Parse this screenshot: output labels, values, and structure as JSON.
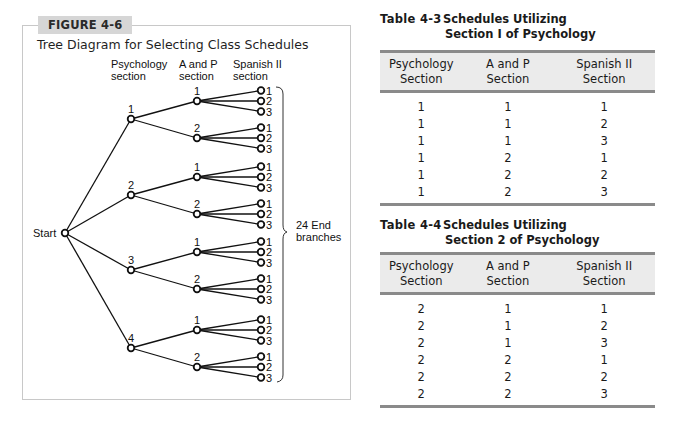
{
  "figure": {
    "tag": "FIGURE 4-6",
    "title": "Tree Diagram for Selecting Class Schedules",
    "column_headers": {
      "psychology": [
        "Psychology",
        "section"
      ],
      "anp": [
        "A and P",
        "section"
      ],
      "spanish": [
        "Spanish II",
        "section"
      ]
    },
    "start_label": "Start",
    "brace_label": [
      "24 End",
      "branches"
    ],
    "tree": {
      "psychology_sections": [
        "1",
        "2",
        "3",
        "4"
      ],
      "anp_sections": [
        "1",
        "2"
      ],
      "spanish_sections": [
        "1",
        "2",
        "3"
      ],
      "end_branch_count": 24
    }
  },
  "table_4_3": {
    "number": "Table 4-3",
    "title_line1": "Schedules Utilizing",
    "title_line2": "Section I of Psychology",
    "headers": [
      [
        "Psychology",
        "Section"
      ],
      [
        "A and P",
        "Section"
      ],
      [
        "Spanish II",
        "Section"
      ]
    ],
    "rows": [
      [
        "1",
        "1",
        "1"
      ],
      [
        "1",
        "1",
        "2"
      ],
      [
        "1",
        "1",
        "3"
      ],
      [
        "1",
        "2",
        "1"
      ],
      [
        "1",
        "2",
        "2"
      ],
      [
        "1",
        "2",
        "3"
      ]
    ]
  },
  "table_4_4": {
    "number": "Table 4-4",
    "title_line1": "Schedules Utilizing",
    "title_line2": "Section 2 of Psychology",
    "headers": [
      [
        "Psychology",
        "Section"
      ],
      [
        "A and P",
        "Section"
      ],
      [
        "Spanish II",
        "Section"
      ]
    ],
    "rows": [
      [
        "2",
        "1",
        "1"
      ],
      [
        "2",
        "1",
        "2"
      ],
      [
        "2",
        "1",
        "3"
      ],
      [
        "2",
        "2",
        "1"
      ],
      [
        "2",
        "2",
        "2"
      ],
      [
        "2",
        "2",
        "3"
      ]
    ]
  },
  "colors": {
    "figure_tag_bg": "#d6d6d6",
    "frame_border": "#c8c8c8",
    "table_header_bg": "#ebebeb",
    "table_rule": "#8a8a8a"
  }
}
